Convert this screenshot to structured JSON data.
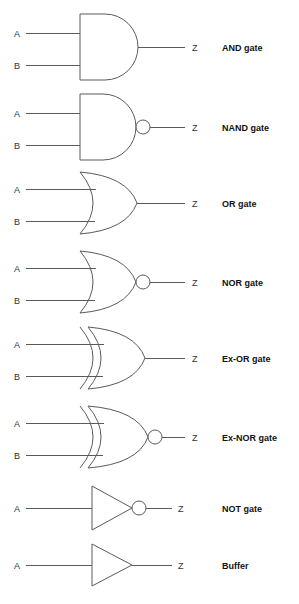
{
  "page": {
    "background_color": "#ffffff",
    "line_color": "#5a5a5a",
    "text_color": "#333333",
    "label_color": "#111111"
  },
  "columns": {
    "input_label_x": 14,
    "input_wire_start_x": 26,
    "gate_left_x": 80,
    "output_label_x": 192,
    "output_label_x_single": 178,
    "name_label_x": 222
  },
  "gates": [
    {
      "id": "and",
      "shape": "and",
      "name": "AND gate",
      "inputs": [
        "A",
        "B"
      ],
      "output": "Z",
      "inverted": false,
      "exclusive": false,
      "center_y": 47,
      "top_y": 14,
      "bottom_y": 80,
      "input_ys": [
        33,
        65
      ],
      "body_left_x": 80,
      "body_right_x": 138,
      "bubble_cx": 0,
      "bubble_r": 0,
      "output_wire_start_x": 138,
      "output_wire_end_x": 185,
      "output_label": "Z",
      "output_label_x": 192
    },
    {
      "id": "nand",
      "shape": "and",
      "name": "NAND gate",
      "inputs": [
        "A",
        "B"
      ],
      "output": "Z",
      "inverted": true,
      "exclusive": false,
      "center_y": 127,
      "top_y": 94,
      "bottom_y": 160,
      "input_ys": [
        113,
        145
      ],
      "body_left_x": 80,
      "body_right_x": 136,
      "bubble_cx": 143,
      "bubble_r": 7,
      "output_wire_start_x": 150,
      "output_wire_end_x": 185,
      "output_label": "Z",
      "output_label_x": 192
    },
    {
      "id": "or",
      "shape": "or",
      "name": "OR gate",
      "inputs": [
        "A",
        "B"
      ],
      "output": "Z",
      "inverted": false,
      "exclusive": false,
      "center_y": 203,
      "top_y": 172,
      "bottom_y": 234,
      "input_ys": [
        189,
        221
      ],
      "body_left_x": 80,
      "body_right_x": 137,
      "bubble_cx": 0,
      "bubble_r": 0,
      "output_wire_start_x": 137,
      "output_wire_end_x": 185,
      "output_label": "Z",
      "output_label_x": 192
    },
    {
      "id": "nor",
      "shape": "or",
      "name": "NOR gate",
      "inputs": [
        "A",
        "B"
      ],
      "output": "Z",
      "inverted": true,
      "exclusive": false,
      "center_y": 282,
      "top_y": 251,
      "bottom_y": 313,
      "input_ys": [
        268,
        300
      ],
      "body_left_x": 80,
      "body_right_x": 136,
      "bubble_cx": 143,
      "bubble_r": 7,
      "output_wire_start_x": 150,
      "output_wire_end_x": 185,
      "output_label": "Z",
      "output_label_x": 192
    },
    {
      "id": "exor",
      "shape": "or",
      "name": "Ex-OR gate",
      "inputs": [
        "A",
        "B"
      ],
      "output": "Z",
      "inverted": false,
      "exclusive": true,
      "center_y": 358,
      "top_y": 327,
      "bottom_y": 389,
      "input_ys": [
        344,
        376
      ],
      "body_left_x": 88,
      "body_right_x": 145,
      "bubble_cx": 0,
      "bubble_r": 0,
      "output_wire_start_x": 145,
      "output_wire_end_x": 185,
      "output_label": "Z",
      "output_label_x": 192
    },
    {
      "id": "exnor",
      "shape": "or",
      "name": "Ex-NOR gate",
      "inputs": [
        "A",
        "B"
      ],
      "output": "Z",
      "inverted": true,
      "exclusive": true,
      "center_y": 437,
      "top_y": 406,
      "bottom_y": 468,
      "input_ys": [
        423,
        455
      ],
      "body_left_x": 88,
      "body_right_x": 148,
      "bubble_cx": 155,
      "bubble_r": 7,
      "output_wire_start_x": 162,
      "output_wire_end_x": 185,
      "output_label": "Z",
      "output_label_x": 192
    },
    {
      "id": "not",
      "shape": "triangle",
      "name": "NOT gate",
      "inputs": [
        "A"
      ],
      "output": "Z",
      "inverted": true,
      "exclusive": false,
      "center_y": 508,
      "top_y": 486,
      "bottom_y": 530,
      "input_ys": [
        508
      ],
      "body_left_x": 92,
      "body_right_x": 132,
      "bubble_cx": 139,
      "bubble_r": 7,
      "output_wire_start_x": 146,
      "output_wire_end_x": 172,
      "output_label": "Z",
      "output_label_x": 178
    },
    {
      "id": "buffer",
      "shape": "triangle",
      "name": "Buffer",
      "inputs": [
        "A"
      ],
      "output": "Z",
      "inverted": false,
      "exclusive": false,
      "center_y": 565,
      "top_y": 544,
      "bottom_y": 586,
      "input_ys": [
        565
      ],
      "body_left_x": 92,
      "body_right_x": 132,
      "bubble_cx": 0,
      "bubble_r": 0,
      "output_wire_start_x": 132,
      "output_wire_end_x": 172,
      "output_label": "Z",
      "output_label_x": 178
    }
  ]
}
